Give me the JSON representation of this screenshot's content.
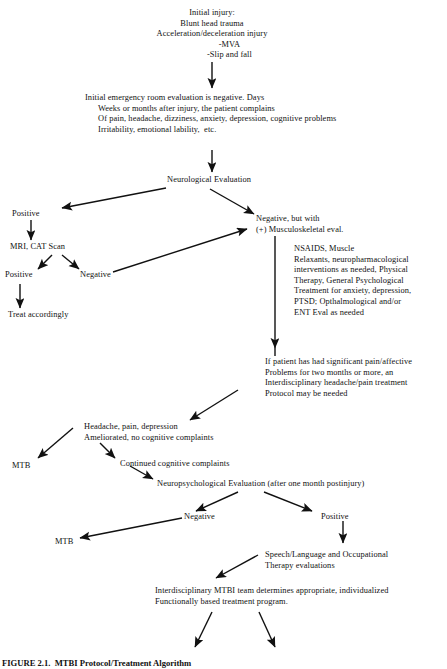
{
  "figure": {
    "caption": "FIGURE 2.1.  MTBI Protocol/Treatment Algorithm",
    "type": "flowchart",
    "domain": "clinical treatment algorithm"
  },
  "nodes": {
    "initial_injury": "Initial injury:\nBlunt head trauma\nAcceleration/deceleration injury\n                -MVA\n                -Slip and fall",
    "er_evaluation": "Initial emergency room evaluation is negative. Days\n      Weeks or months after injury, the patient complains\n      Of pain, headache, dizziness, anxiety, depression, cognitive problems\n      Irritability, emotional lability,  etc.",
    "neuro_eval": "Neurological Evaluation",
    "positive_neuro": "Positive",
    "negative_musculo": "Negative, but with\n(+) Musculoskeletal eval.",
    "mri_cat_scan": "MRI, CAT Scan",
    "mri_positive": "Positive",
    "mri_negative": "Negative",
    "treat_accordingly": "Treat accordingly",
    "nsaids_block": "NSAIDS, Muscle\nRelaxants, neuropharmacological\ninterventions as needed, Physical\nTherapy, General Psychological\nTreatment for anxiety, depression,\nPTSD; Opthalmological and/or\nENT Eval as needed",
    "interdisciplinary_pain": "If patient has had significant pain/affective\nProblems for two months or more, an\nInterdisciplinary headache/pain treatment\nProtocol may be needed",
    "headache_ameliorated": "Headache, pain, depression\nAmeliorated, no cognitive complaints",
    "mtb_left_upper": "MTB",
    "continued_cognitive": "Continued cognitive complaints",
    "neuropsych_eval": "Neuropsychological Evaluation (after one month postinjury)",
    "np_negative": "Negative",
    "np_positive": "Positive",
    "mtb_left_lower": "MTB",
    "speech_language": "Speech/Language and Occupational\nTherapy evaluations",
    "mtbi_team": "Interdisciplinary MTBI team determines appropriate, individualized\nFunctionally based treatment program."
  },
  "edges": [
    {
      "name": "injury-to-er",
      "from": "initial_injury",
      "to": "er_evaluation"
    },
    {
      "name": "er-to-neuro",
      "from": "er_evaluation",
      "to": "neuro_eval"
    },
    {
      "name": "neuro-to-positive",
      "from": "neuro_eval",
      "to": "positive_neuro"
    },
    {
      "name": "neuro-to-negative",
      "from": "neuro_eval",
      "to": "negative_musculo"
    },
    {
      "name": "positive-to-mri",
      "from": "positive_neuro",
      "to": "mri_cat_scan"
    },
    {
      "name": "mri-to-positive",
      "from": "mri_cat_scan",
      "to": "mri_positive"
    },
    {
      "name": "mri-to-negative",
      "from": "mri_cat_scan",
      "to": "mri_negative"
    },
    {
      "name": "mripositive-to-treat",
      "from": "mri_positive",
      "to": "treat_accordingly"
    },
    {
      "name": "mrinegative-to-musculo",
      "from": "mri_negative",
      "to": "negative_musculo"
    },
    {
      "name": "musculo-to-nsaids",
      "from": "negative_musculo",
      "to": "nsaids_block"
    },
    {
      "name": "nsaids-to-pain-protocol",
      "from": "nsaids_block",
      "to": "interdisciplinary_pain"
    },
    {
      "name": "protocol-to-headache",
      "from": "interdisciplinary_pain",
      "to": "headache_ameliorated"
    },
    {
      "name": "headache-to-mtb",
      "from": "headache_ameliorated",
      "to": "mtb_left_upper"
    },
    {
      "name": "headache-to-continued",
      "from": "headache_ameliorated",
      "to": "continued_cognitive"
    },
    {
      "name": "continued-to-neuropsych",
      "from": "continued_cognitive",
      "to": "neuropsych_eval"
    },
    {
      "name": "neuropsych-to-negative",
      "from": "neuropsych_eval",
      "to": "np_negative"
    },
    {
      "name": "neuropsych-to-positive",
      "from": "neuropsych_eval",
      "to": "np_positive"
    },
    {
      "name": "npnegative-to-mtb",
      "from": "np_negative",
      "to": "mtb_left_lower"
    },
    {
      "name": "nppositive-to-speech",
      "from": "np_positive",
      "to": "speech_language"
    },
    {
      "name": "speech-to-team",
      "from": "speech_language",
      "to": "mtbi_team"
    },
    {
      "name": "team-to-branch-left",
      "from": "mtbi_team",
      "to": "unlabeled-left"
    },
    {
      "name": "team-to-branch-right",
      "from": "mtbi_team",
      "to": "unlabeled-right"
    }
  ],
  "style": {
    "stroke_color": "#111111",
    "text_color": "#111111",
    "background": "#ffffff"
  }
}
